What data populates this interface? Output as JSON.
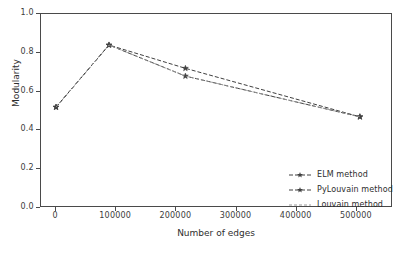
{
  "chart_data": {
    "type": "line",
    "title": "",
    "xlabel": "Number of edges",
    "ylabel": "Modularity",
    "xlim": [
      -25000,
      560000
    ],
    "ylim": [
      0.0,
      1.0
    ],
    "grid": false,
    "legend_position": "lower right",
    "xticks": [
      "0",
      "100000",
      "200000",
      "300000",
      "400000",
      "500000"
    ],
    "xtick_values": [
      0,
      100000,
      200000,
      300000,
      400000,
      500000
    ],
    "yticks": [
      "0.0",
      "0.2",
      "0.4",
      "0.6",
      "0.8",
      "1.0"
    ],
    "ytick_values": [
      0.0,
      0.2,
      0.4,
      0.6,
      0.8,
      1.0
    ],
    "x": [
      0,
      88000,
      215000,
      505000
    ],
    "series": [
      {
        "name": "ELM method",
        "values": [
          0.52,
          0.84,
          0.72,
          0.47
        ],
        "color": "#404040",
        "linestyle": "dashed",
        "marker": "star"
      },
      {
        "name": "PyLouvain method",
        "values": [
          0.52,
          0.84,
          0.68,
          0.47
        ],
        "color": "#404040",
        "linestyle": "dashed",
        "marker": "star"
      },
      {
        "name": "Louvain method",
        "values": [
          0.52,
          0.84,
          0.68,
          0.47
        ],
        "color": "#9a9a9a",
        "linestyle": "dashed",
        "marker": "none"
      }
    ]
  },
  "legend": {
    "items": [
      {
        "label": "ELM method"
      },
      {
        "label": "PyLouvain method"
      },
      {
        "label": "Louvain method"
      }
    ]
  },
  "axes": {
    "xlabel": "Number of edges",
    "ylabel": "Modularity"
  }
}
